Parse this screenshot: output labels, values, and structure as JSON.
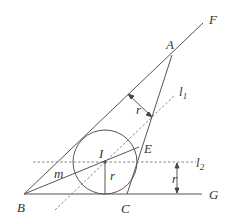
{
  "diagram": {
    "type": "geometry",
    "colors": {
      "stroke": "#555555",
      "dashed": "#777777",
      "text": "#333333",
      "background": "#ffffff"
    },
    "points": {
      "A": {
        "label": "A",
        "x": 172,
        "y": 55
      },
      "B": {
        "label": "B",
        "x": 24,
        "y": 194
      },
      "C": {
        "label": "C",
        "x": 127,
        "y": 194
      },
      "E": {
        "label": "E",
        "x": 139,
        "y": 147
      },
      "I": {
        "label": "I",
        "x": 105,
        "y": 162
      },
      "F": {
        "label": "F",
        "x": 203,
        "y": 23
      },
      "G": {
        "label": "G",
        "x": 202,
        "y": 194
      }
    },
    "labels": {
      "A": "A",
      "B": "B",
      "C": "C",
      "E": "E",
      "I": "I",
      "F": "F",
      "G": "G",
      "m": "m",
      "r_radius": "r",
      "r_top": "r",
      "r_right": "r",
      "l1_main": "l",
      "l1_sub": "1",
      "l2_main": "l",
      "l2_sub": "2"
    },
    "circle": {
      "center": "I",
      "radius": 32
    },
    "segments": [
      {
        "from": "B",
        "to": "F",
        "style": "solid"
      },
      {
        "from": "B",
        "to": "G",
        "style": "solid"
      },
      {
        "from": "A",
        "to": "C",
        "style": "solid"
      },
      {
        "from": "B",
        "to": "E",
        "style": "solid"
      },
      {
        "from": "I",
        "to": "foot",
        "style": "solid"
      }
    ],
    "lines": [
      {
        "name": "l1",
        "style": "dashed",
        "description": "line parallel to AB at distance r"
      },
      {
        "name": "l2",
        "style": "dashed",
        "description": "line parallel to BG at distance r"
      }
    ]
  }
}
